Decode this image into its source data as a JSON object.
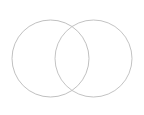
{
  "canvas": {
    "width": 144,
    "height": 115,
    "background_color": "#ffffff",
    "title": "Two overlapping circles"
  },
  "style": {
    "stroke_color": "#b9b9b9",
    "stroke_width": 0.9,
    "fill": "none"
  },
  "shapes": [
    {
      "name": "left-circle",
      "type": "circle",
      "cx": 50.5,
      "cy": 58.5,
      "r": 38.5,
      "stroke_color": "#b9b9b9",
      "stroke_width": 0.9,
      "fill": "none",
      "label": ""
    },
    {
      "name": "right-circle",
      "type": "circle",
      "cx": 93.5,
      "cy": 58.5,
      "r": 38.5,
      "stroke_color": "#bcbcbc",
      "stroke_width": 0.9,
      "fill": "none",
      "label": ""
    }
  ],
  "chart_data": {
    "type": "diagram",
    "subtype": "venn-2set",
    "title": "",
    "sets": [
      {
        "name": "left-set",
        "label": "",
        "cx": 50.5,
        "cy": 58.5,
        "r": 38.5
      },
      {
        "name": "right-set",
        "label": "",
        "cx": 93.5,
        "cy": 58.5,
        "r": 38.5
      }
    ],
    "intersection_points": [
      {
        "x": 72.0,
        "y": 26.6
      },
      {
        "x": 72.0,
        "y": 90.4
      }
    ],
    "center_distance": 43.0,
    "labels": [],
    "annotations": [],
    "legend": []
  }
}
